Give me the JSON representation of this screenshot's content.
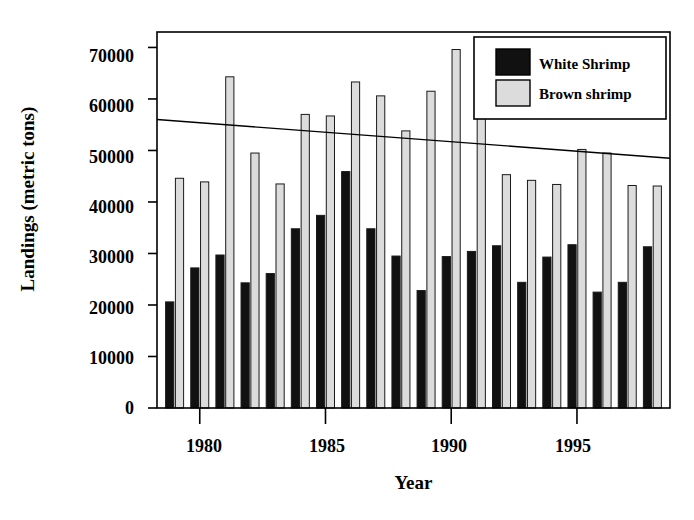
{
  "chart_data": {
    "type": "bar",
    "title": "",
    "xlabel": "Year",
    "ylabel": "Landings (metric tons)",
    "xlim": [
      1978.3,
      1998.7
    ],
    "ylim": [
      0,
      73000
    ],
    "yticks": [
      0,
      10000,
      20000,
      30000,
      40000,
      50000,
      60000,
      70000
    ],
    "ytick_labels": [
      "0",
      "10000",
      "20000",
      "30000",
      "40000",
      "50000",
      "60000",
      "70000"
    ],
    "xticks": [
      1980,
      1985,
      1990,
      1995
    ],
    "xtick_labels": [
      "1980",
      "1985",
      "1990",
      "1995"
    ],
    "grid": false,
    "legend_position": "top-right",
    "categories": [
      1979,
      1980,
      1981,
      1982,
      1983,
      1984,
      1985,
      1986,
      1987,
      1988,
      1989,
      1990,
      1991,
      1992,
      1993,
      1994,
      1995,
      1996,
      1997,
      1998
    ],
    "series": [
      {
        "name": "White Shrimp",
        "color": "#111111",
        "values": [
          20600,
          27200,
          29700,
          24300,
          26100,
          34800,
          37400,
          45900,
          34800,
          29500,
          22800,
          29400,
          30400,
          31500,
          24400,
          29300,
          31700,
          22500,
          24400,
          31300
        ]
      },
      {
        "name": "Brown shrimp",
        "color": "#dcdcdc",
        "values": [
          44600,
          43900,
          64300,
          49500,
          43500,
          57000,
          56700,
          63300,
          60600,
          53800,
          61500,
          69600,
          57600,
          45300,
          44200,
          43400,
          50200,
          49500,
          43200,
          43100
        ]
      }
    ],
    "trendlines": [
      {
        "name": "brown-shrimp-trend",
        "x_start": 1978.3,
        "y_start": 56000,
        "x_end": 1998.7,
        "y_end": 48500
      }
    ]
  },
  "legend": {
    "entries": [
      {
        "label": "White Shrimp",
        "swatch": "#111111"
      },
      {
        "label": "Brown shrimp",
        "swatch": "#dcdcdc"
      }
    ]
  },
  "axes": {
    "y_axis_title": "Landings (metric tons)",
    "x_axis_title": "Year"
  }
}
